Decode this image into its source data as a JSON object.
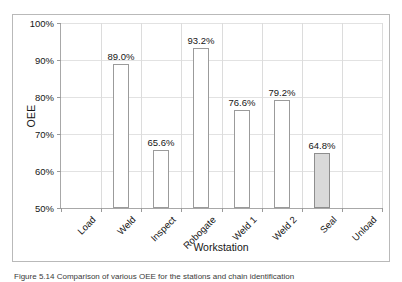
{
  "chart_data": {
    "type": "bar",
    "title": "",
    "xlabel": "Workstation",
    "ylabel": "OEE",
    "categories": [
      "Load",
      "Weld",
      "Inspect",
      "Robogate",
      "Weld 1",
      "Weld 2",
      "Seal",
      "Unload"
    ],
    "values": [
      null,
      89.0,
      65.6,
      93.2,
      76.6,
      79.2,
      64.8,
      null
    ],
    "value_labels": [
      "",
      "89.0%",
      "65.6%",
      "93.2%",
      "76.6%",
      "79.2%",
      "64.8%",
      ""
    ],
    "ylim": [
      50,
      100
    ],
    "yticks": [
      50,
      60,
      70,
      80,
      90,
      100
    ],
    "ytick_labels": [
      "50%",
      "60%",
      "70%",
      "80%",
      "90%",
      "100%"
    ],
    "grid": true,
    "legend": "none",
    "highlighted_category": "Seal",
    "bar_fill_default": "#ffffff",
    "bar_fill_highlight": "#d9d9d9",
    "bar_edge_color": "#9b9b9b",
    "gridline_color": "#e2e2e2",
    "axis_color": "#a8a8a8"
  },
  "caption": {
    "label": "Figure 5.14",
    "text": "Figure 5.14   Comparison of various OEE for the stations and chain identification"
  }
}
